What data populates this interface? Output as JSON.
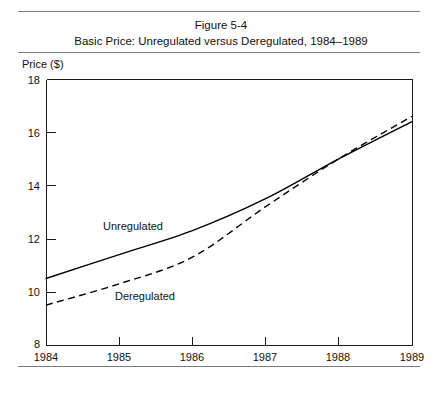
{
  "figure": {
    "number": "Figure 5-4",
    "title": "Basic Price: Unregulated versus Deregulated, 1984–1989"
  },
  "axis": {
    "y_title": "Price ($)",
    "y_ticks": [
      "18",
      "16",
      "14",
      "12",
      "10",
      "8"
    ],
    "x_ticks": [
      "1984",
      "1985",
      "1986",
      "1987",
      "1988",
      "1989"
    ]
  },
  "series_labels": {
    "unregulated": "Unregulated",
    "deregulated": "Deregulated"
  },
  "chart_data": {
    "type": "line",
    "title": "Basic Price: Unregulated versus Deregulated, 1984–1989",
    "subtitle": "Figure 5-4",
    "xlabel": "",
    "ylabel": "Price ($)",
    "x": [
      1984,
      1985,
      1986,
      1987,
      1988,
      1989
    ],
    "xlim": [
      1984,
      1989
    ],
    "ylim": [
      8,
      18
    ],
    "y_ticks": [
      8,
      10,
      12,
      14,
      16,
      18
    ],
    "x_ticks": [
      1984,
      1985,
      1986,
      1987,
      1988,
      1989
    ],
    "grid": false,
    "legend": "inline-annotations",
    "series": [
      {
        "name": "Unregulated",
        "style": "solid",
        "color": "#000000",
        "values": [
          10.5,
          11.4,
          12.3,
          13.5,
          15.0,
          16.4
        ]
      },
      {
        "name": "Deregulated",
        "style": "dashed",
        "color": "#000000",
        "values": [
          9.5,
          10.3,
          11.3,
          13.2,
          15.0,
          16.6
        ]
      }
    ],
    "annotations": [
      {
        "text": "Unregulated",
        "x": 1984.8,
        "y": 12.9
      },
      {
        "text": "Deregulated",
        "x": 1984.95,
        "y": 10.3
      }
    ]
  }
}
